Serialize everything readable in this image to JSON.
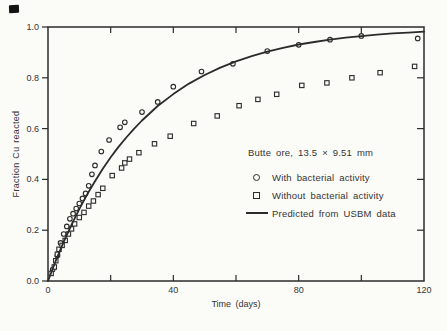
{
  "colors": {
    "ink": "#2b2b2b",
    "paper": "#fbfbf8",
    "text": "#343434"
  },
  "chart_data": {
    "type": "scatter",
    "title": "",
    "annotation": "Butte ore, 13.5 × 9.51 mm",
    "xlabel": "Time (days)",
    "ylabel": "Fraction Cu reacted",
    "xlim": [
      0,
      120
    ],
    "ylim": [
      0,
      1.0
    ],
    "grid": false,
    "frame": "box",
    "legend_position": "inside lower-right",
    "x_ticks_unlabeled": [
      20,
      40,
      60,
      80,
      100
    ],
    "x_tick_labels": [
      {
        "value": 0,
        "label": "0"
      },
      {
        "value": 40,
        "label": "40"
      },
      {
        "value": 80,
        "label": "80"
      },
      {
        "value": 120,
        "label": "120"
      }
    ],
    "y_tick_labels": [
      {
        "value": 0.0,
        "label": "0.0"
      },
      {
        "value": 0.2,
        "label": "0.2"
      },
      {
        "value": 0.4,
        "label": "0.4"
      },
      {
        "value": 0.6,
        "label": "0.6"
      },
      {
        "value": 0.8,
        "label": "0.8"
      },
      {
        "value": 1.0,
        "label": "1.0"
      }
    ],
    "series": [
      {
        "name": "With bacterial activity",
        "marker": "circle",
        "points": [
          [
            1.5,
            0.045
          ],
          [
            3,
            0.1
          ],
          [
            4,
            0.15
          ],
          [
            5,
            0.185
          ],
          [
            6,
            0.215
          ],
          [
            7,
            0.245
          ],
          [
            8,
            0.265
          ],
          [
            9,
            0.285
          ],
          [
            10,
            0.305
          ],
          [
            11,
            0.325
          ],
          [
            12,
            0.345
          ],
          [
            13,
            0.375
          ],
          [
            14,
            0.42
          ],
          [
            15,
            0.455
          ],
          [
            17,
            0.51
          ],
          [
            19.5,
            0.555
          ],
          [
            23,
            0.605
          ],
          [
            24.5,
            0.625
          ],
          [
            30,
            0.665
          ],
          [
            35,
            0.705
          ],
          [
            40,
            0.765
          ],
          [
            49,
            0.825
          ],
          [
            59,
            0.855
          ],
          [
            70,
            0.905
          ],
          [
            80,
            0.93
          ],
          [
            90,
            0.95
          ],
          [
            100,
            0.965
          ],
          [
            118,
            0.955
          ]
        ]
      },
      {
        "name": "Without bacterial activity",
        "marker": "square",
        "points": [
          [
            1,
            0.03
          ],
          [
            2,
            0.055
          ],
          [
            2.5,
            0.08
          ],
          [
            3,
            0.105
          ],
          [
            3.5,
            0.125
          ],
          [
            4.5,
            0.14
          ],
          [
            5.5,
            0.16
          ],
          [
            6.5,
            0.185
          ],
          [
            7.5,
            0.205
          ],
          [
            8.5,
            0.225
          ],
          [
            10,
            0.25
          ],
          [
            11.5,
            0.27
          ],
          [
            13,
            0.295
          ],
          [
            14.5,
            0.315
          ],
          [
            16,
            0.34
          ],
          [
            17.5,
            0.365
          ],
          [
            20.5,
            0.415
          ],
          [
            23.5,
            0.445
          ],
          [
            24.5,
            0.465
          ],
          [
            26,
            0.48
          ],
          [
            29,
            0.505
          ],
          [
            34,
            0.54
          ],
          [
            39,
            0.57
          ],
          [
            46.5,
            0.62
          ],
          [
            54,
            0.65
          ],
          [
            61,
            0.69
          ],
          [
            67,
            0.715
          ],
          [
            73,
            0.735
          ],
          [
            81,
            0.77
          ],
          [
            89,
            0.78
          ],
          [
            97,
            0.8
          ],
          [
            106,
            0.82
          ],
          [
            117,
            0.845
          ]
        ]
      },
      {
        "name": "Predicted from USBM data",
        "marker": "line",
        "points": [
          [
            0,
            0.0
          ],
          [
            2.5,
            0.08
          ],
          [
            5,
            0.154
          ],
          [
            7.5,
            0.221
          ],
          [
            10,
            0.283
          ],
          [
            12.5,
            0.341
          ],
          [
            15,
            0.393
          ],
          [
            17.5,
            0.442
          ],
          [
            20,
            0.487
          ],
          [
            22.5,
            0.528
          ],
          [
            25,
            0.565
          ],
          [
            27.5,
            0.6
          ],
          [
            30,
            0.632
          ],
          [
            35,
            0.689
          ],
          [
            40,
            0.736
          ],
          [
            45,
            0.777
          ],
          [
            50,
            0.811
          ],
          [
            55,
            0.84
          ],
          [
            60,
            0.865
          ],
          [
            65,
            0.885
          ],
          [
            70,
            0.903
          ],
          [
            75,
            0.918
          ],
          [
            80,
            0.931
          ],
          [
            85,
            0.941
          ],
          [
            90,
            0.95
          ],
          [
            95,
            0.958
          ],
          [
            100,
            0.964
          ],
          [
            105,
            0.97
          ],
          [
            110,
            0.975
          ],
          [
            115,
            0.978
          ],
          [
            120,
            0.982
          ]
        ]
      }
    ]
  }
}
